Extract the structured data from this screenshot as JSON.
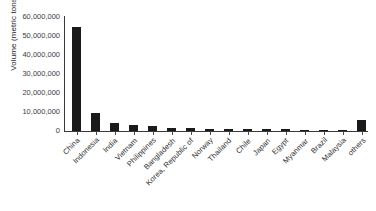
{
  "chart_data": {
    "type": "bar",
    "title": "",
    "xlabel": "",
    "ylabel": "Volume (metric tons)",
    "ylim": [
      0,
      60000000
    ],
    "ytick_labels": [
      "60,000,000",
      "50,000,000",
      "40,000,000",
      "30,000,000",
      "20,000,000",
      "10,000,000",
      "0"
    ],
    "ytick_values": [
      60000000,
      50000000,
      40000000,
      30000000,
      20000000,
      10000000,
      0
    ],
    "grid": false,
    "legend": null,
    "bar_color": "#1a1a1a",
    "categories": [
      "China",
      "Indonesia",
      "India",
      "Vietnam",
      "Philippines",
      "Bangladesh",
      "Korea, Republic of",
      "Norway",
      "Thailand",
      "Chile",
      "Japan",
      "Egypt",
      "Myanmar",
      "Brazil",
      "Malaysia",
      "others"
    ],
    "values": [
      55000000,
      9600000,
      4100000,
      3400000,
      2400000,
      1600000,
      1400000,
      1300000,
      1300000,
      1100000,
      1000000,
      1000000,
      700000,
      600000,
      400000,
      5800000
    ]
  }
}
